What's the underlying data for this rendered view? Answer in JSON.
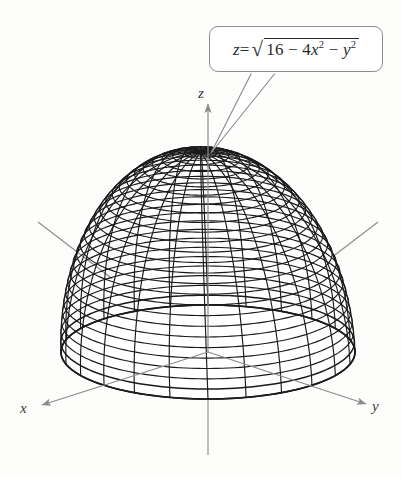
{
  "figure": {
    "kind": "3d-surface-wireframe",
    "background_color": "#fdfdfc"
  },
  "callout": {
    "name": "equation-callout",
    "equation_plain": "z = sqrt(16 - 4x^2 - y^2)",
    "lhs": "z",
    "equals": "=",
    "radical_sign": "√",
    "radicand_parts": [
      {
        "text": "16",
        "italic": false,
        "sup": ""
      },
      {
        "text": " − 4",
        "italic": false,
        "sup": ""
      },
      {
        "text": "x",
        "italic": true,
        "sup": "2"
      },
      {
        "text": " − ",
        "italic": false,
        "sup": ""
      },
      {
        "text": "y",
        "italic": true,
        "sup": "2"
      }
    ],
    "border_color": "#8d8d8d",
    "text_color": "#2b2b2b",
    "pointer_target": "surface-apex"
  },
  "axes": {
    "color": "#8a8a8a",
    "label_color": "#3a3a3a",
    "items": [
      {
        "id": "x",
        "label": "x",
        "direction": "lower-left",
        "arrow": true
      },
      {
        "id": "y",
        "label": "y",
        "direction": "lower-right",
        "arrow": true
      },
      {
        "id": "z",
        "label": "z",
        "direction": "up",
        "arrow": true
      }
    ],
    "origin_px": [
      208,
      352
    ]
  },
  "surface": {
    "name": "half-ellipsoid-dome",
    "line_color": "#1a1a1a",
    "fill_color": "#ffffff",
    "semi_axis_a": 2,
    "semi_axis_b": 4,
    "semi_axis_c": 4,
    "meridian_count": 24,
    "latitude_count": 26,
    "apex_px": [
      208,
      152
    ],
    "center_px": [
      208,
      352
    ],
    "radius_x_px": 147,
    "radius_y_px": 47,
    "height_px": 200
  },
  "chart_data": {
    "type": "surface",
    "equation": "z = sqrt(16 - 4*x^2 - y^2)",
    "surface_form": "upper half-ellipsoid",
    "canonical_form": "x^2/4 + y^2/16 + z^2/16 = 1, z >= 0",
    "xlabel": "x",
    "ylabel": "y",
    "zlabel": "z",
    "x_intercepts": [
      -2,
      2
    ],
    "y_intercepts": [
      -4,
      4
    ],
    "z_intercept": 4,
    "domain_description": "4x^2 + y^2 <= 16",
    "grid": true,
    "legend": false
  },
  "ghost_text": {
    "note": "faint bleed-through from reverse page of scan",
    "lines": [
      "",
      "",
      "",
      ""
    ]
  }
}
